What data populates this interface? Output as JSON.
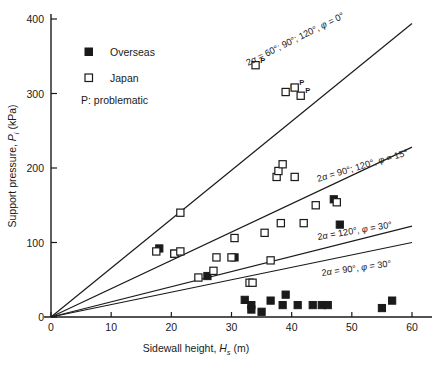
{
  "chart_data": {
    "type": "scatter",
    "title": "",
    "xlabel": "Sidewall height, Hs (m)",
    "ylabel": "Support pressure, Pi (kPa)",
    "xlim": [
      0,
      60
    ],
    "ylim": [
      0,
      400
    ],
    "xticks": [
      0,
      10,
      20,
      30,
      40,
      50,
      60
    ],
    "yticks": [
      0,
      100,
      200,
      300,
      400
    ],
    "grid": false,
    "legend_position": "upper-left",
    "legend": [
      {
        "label": "Overseas",
        "marker": "filled-square"
      },
      {
        "label": "Japan",
        "marker": "open-square"
      }
    ],
    "legend_note": "P: problematic",
    "series": [
      {
        "name": "Overseas",
        "marker": "filled-square",
        "points": [
          {
            "x": 18.0,
            "y": 92
          },
          {
            "x": 20.5,
            "y": 85
          },
          {
            "x": 26.0,
            "y": 55
          },
          {
            "x": 30.5,
            "y": 80
          },
          {
            "x": 32.2,
            "y": 23
          },
          {
            "x": 33.3,
            "y": 16
          },
          {
            "x": 33.3,
            "y": 10
          },
          {
            "x": 35.0,
            "y": 7
          },
          {
            "x": 36.5,
            "y": 22
          },
          {
            "x": 38.5,
            "y": 16
          },
          {
            "x": 39.0,
            "y": 30
          },
          {
            "x": 41.0,
            "y": 16
          },
          {
            "x": 43.5,
            "y": 16
          },
          {
            "x": 45.0,
            "y": 16
          },
          {
            "x": 46.0,
            "y": 16
          },
          {
            "x": 48.0,
            "y": 124
          },
          {
            "x": 55.0,
            "y": 12
          },
          {
            "x": 56.7,
            "y": 22
          },
          {
            "x": 47.0,
            "y": 158
          }
        ]
      },
      {
        "name": "Japan",
        "marker": "open-square",
        "points": [
          {
            "x": 17.5,
            "y": 88
          },
          {
            "x": 20.5,
            "y": 85
          },
          {
            "x": 21.5,
            "y": 88
          },
          {
            "x": 21.5,
            "y": 140
          },
          {
            "x": 24.5,
            "y": 53
          },
          {
            "x": 27.0,
            "y": 62
          },
          {
            "x": 27.5,
            "y": 80
          },
          {
            "x": 30.0,
            "y": 80
          },
          {
            "x": 30.5,
            "y": 106
          },
          {
            "x": 33.0,
            "y": 46
          },
          {
            "x": 33.5,
            "y": 46
          },
          {
            "x": 35.5,
            "y": 113
          },
          {
            "x": 37.5,
            "y": 188
          },
          {
            "x": 37.8,
            "y": 196
          },
          {
            "x": 38.5,
            "y": 205
          },
          {
            "x": 38.2,
            "y": 126
          },
          {
            "x": 40.5,
            "y": 188
          },
          {
            "x": 42.0,
            "y": 126
          },
          {
            "x": 44.0,
            "y": 150
          },
          {
            "x": 47.5,
            "y": 154
          },
          {
            "x": 36.5,
            "y": 76
          }
        ]
      },
      {
        "name": "Japan problematic",
        "marker": "open-square",
        "annotation": "P",
        "points": [
          {
            "x": 34.0,
            "y": 338
          },
          {
            "x": 39.0,
            "y": 302
          },
          {
            "x": 40.5,
            "y": 308
          },
          {
            "x": 41.5,
            "y": 297
          }
        ]
      }
    ],
    "curves": [
      {
        "label": "2a = 60°; 90°; 120°, φ = 0°",
        "x_end": 60,
        "y_end": 394,
        "slope_kpa_per_m": 6.57
      },
      {
        "label": "2a = 90°; 120°, φ = 15°",
        "x_end": 60,
        "y_end": 228,
        "slope_kpa_per_m": 3.8
      },
      {
        "label": "2a = 120°, φ = 30°",
        "x_end": 60,
        "y_end": 122,
        "slope_kpa_per_m": 2.03
      },
      {
        "label": "2a = 90°, φ = 30°",
        "x_end": 60,
        "y_end": 100,
        "slope_kpa_per_m": 1.67
      }
    ],
    "curve_labels_display": [
      {
        "text_parts": [
          "2",
          "α",
          " = 60°; 90°; 120°, ",
          "φ",
          " = 0°"
        ]
      },
      {
        "text_parts": [
          "2",
          "α",
          " = 90°; 120°, ",
          "φ",
          " = 15°"
        ]
      },
      {
        "text_parts": [
          "2",
          "α",
          " = 120°, ",
          "φ",
          " = 30°"
        ]
      },
      {
        "text_parts": [
          "2",
          "α",
          " = 90°, ",
          "φ",
          " = 30°"
        ]
      }
    ]
  },
  "axis": {
    "x_title_pre": "Sidewall height, ",
    "x_title_sym": "H",
    "x_title_sub": "s",
    "x_title_post": " (m)",
    "y_title_pre": "Support pressure, ",
    "y_title_sym": "P",
    "y_title_sub": "i",
    "y_title_post": " (kPa)",
    "xtick_labels": [
      "0",
      "10",
      "20",
      "30",
      "40",
      "50",
      "60"
    ],
    "ytick_labels": [
      "0",
      "100",
      "200",
      "300",
      "400"
    ]
  },
  "legend": {
    "overseas": "Overseas",
    "japan": "Japan",
    "note": "P: problematic"
  },
  "curve_label_1": {
    "a": "2",
    "alpha": "α",
    "mid": " = 60°; 90°; 120°, ",
    "phi": "φ",
    "tail": " = 0°"
  },
  "curve_label_2": {
    "a": "2",
    "alpha": "α",
    "mid": " = 90°; 120°, ",
    "phi": "φ",
    "tail": " = 15°"
  },
  "curve_label_3": {
    "a": "2",
    "alpha": "α",
    "mid": " = 120°, ",
    "phi": "φ",
    "tail": " = 30°"
  },
  "curve_label_4": {
    "a": "2",
    "alpha": "α",
    "mid": " = 90°, ",
    "phi": "φ",
    "tail": " = 30°"
  },
  "colors": {
    "ink": "#1a1a1a",
    "background": "#ffffff",
    "marker_filled": "#1a1a1a",
    "marker_open": "#ffffff"
  }
}
